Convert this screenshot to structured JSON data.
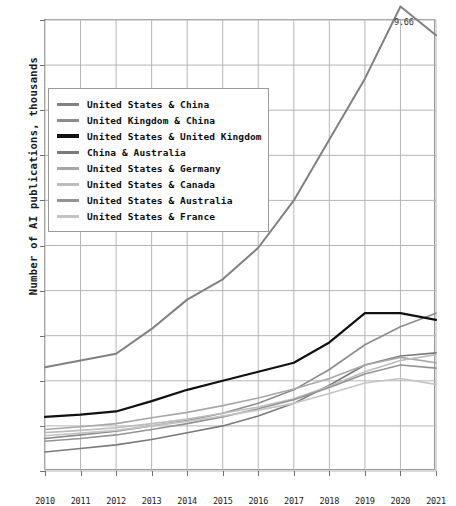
{
  "chart_data": {
    "type": "line",
    "title": "",
    "xlabel": "",
    "ylabel": "Number of AI publications, thousands",
    "x": [
      2010,
      2011,
      2012,
      2013,
      2014,
      2015,
      2016,
      2017,
      2018,
      2019,
      2020,
      2021
    ],
    "xlim": [
      2010,
      2021
    ],
    "ylim": [
      0,
      10
    ],
    "yticks": [
      "0",
      "1",
      "2",
      "3",
      "4",
      "5",
      "6",
      "7",
      "8",
      "9",
      "10"
    ],
    "xticks": [
      "2010",
      "2011",
      "2012",
      "2013",
      "2014",
      "2015",
      "2016",
      "2017",
      "2018",
      "2019",
      "2020",
      "2021"
    ],
    "grid": true,
    "legend_position": "upper-left",
    "annotations": [
      {
        "text": "9.66",
        "x": 2021,
        "y": 9.66
      }
    ],
    "series": [
      {
        "name": "United States & China",
        "color": "#808080",
        "width": 2.0,
        "values": [
          2.3,
          2.45,
          2.6,
          3.15,
          3.8,
          4.25,
          4.95,
          6.0,
          7.35,
          8.7,
          10.3,
          9.66
        ]
      },
      {
        "name": "United Kingdom & China",
        "color": "#8c8c8c",
        "width": 1.6,
        "values": [
          0.72,
          0.8,
          0.88,
          1.0,
          1.12,
          1.28,
          1.5,
          1.8,
          2.25,
          2.8,
          3.2,
          3.5
        ]
      },
      {
        "name": "United States & United Kingdom",
        "color": "#111111",
        "width": 2.2,
        "values": [
          1.2,
          1.25,
          1.32,
          1.55,
          1.8,
          2.0,
          2.2,
          2.4,
          2.85,
          3.5,
          3.5,
          3.35
        ]
      },
      {
        "name": "China & Australia",
        "color": "#7a7a7a",
        "width": 1.6,
        "values": [
          0.42,
          0.5,
          0.58,
          0.7,
          0.85,
          1.0,
          1.22,
          1.5,
          1.9,
          2.35,
          2.55,
          2.62
        ]
      },
      {
        "name": "United States & Germany",
        "color": "#a8a8a8",
        "width": 1.6,
        "values": [
          0.92,
          0.98,
          1.05,
          1.18,
          1.3,
          1.45,
          1.62,
          1.82,
          2.05,
          2.35,
          2.52,
          2.4
        ]
      },
      {
        "name": "United States & Canada",
        "color": "#bdbdbd",
        "width": 1.6,
        "values": [
          0.85,
          0.9,
          0.96,
          1.05,
          1.15,
          1.28,
          1.42,
          1.6,
          1.88,
          2.2,
          2.45,
          2.58
        ]
      },
      {
        "name": "United States & Australia",
        "color": "#949494",
        "width": 1.6,
        "values": [
          0.66,
          0.72,
          0.8,
          0.92,
          1.05,
          1.2,
          1.38,
          1.58,
          1.85,
          2.15,
          2.35,
          2.28
        ]
      },
      {
        "name": "United States & France",
        "color": "#c4c4c4",
        "width": 1.6,
        "values": [
          0.78,
          0.84,
          0.9,
          1.0,
          1.1,
          1.22,
          1.35,
          1.5,
          1.72,
          1.95,
          2.05,
          1.92
        ]
      }
    ]
  }
}
